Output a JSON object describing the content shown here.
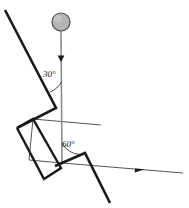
{
  "figure": {
    "name": "inclined-plane-pendulum-diagram",
    "width": 189,
    "height": 208,
    "background_color": "#ffffff"
  },
  "labels": {
    "angle_upper": "30°",
    "angle_lower": "60°"
  },
  "colors": {
    "thick_stroke": "#1a1a1a",
    "thin_stroke": "#555555",
    "ball_fill": "#b3b3b3",
    "ball_stroke": "#4d4d4d",
    "string": "#8c8c8c",
    "text": "#1a1a1a"
  },
  "elements": {
    "ball": {
      "name": "ball",
      "cx": 61,
      "cy": 22,
      "r": 9,
      "fill": "#b3b3b3",
      "stroke": "#4d4d4d"
    },
    "string": {
      "name": "string-vertical-line",
      "x1": 61,
      "y1": 31,
      "x2": 62,
      "y2": 163,
      "stroke": "#8c8c8c"
    },
    "string_arrow": {
      "name": "downward-arrowhead",
      "x": 61,
      "y": 60,
      "direction": "down"
    },
    "incline_upper": {
      "name": "incline-thick-line-upper",
      "points": "5,10 56,108"
    },
    "incline_lower": {
      "name": "incline-thick-line-lower",
      "points": "56,108 17,128"
    },
    "rhombus": {
      "name": "thick-rhombus-block",
      "points": "17,128 33,119 61,168 44,179"
    },
    "rhombus_lower": {
      "name": "thick-lower-edge",
      "points": "44,179 61,168"
    },
    "v_shape": {
      "name": "thick-v-wedge",
      "points": "62,163 85,153 110,203"
    },
    "parallelogram": {
      "name": "thin-parallelogram",
      "points": "33,119 96,119 62,163 29,163"
    },
    "ray": {
      "name": "thin-ray-right",
      "x1": 62,
      "y1": 163,
      "x2": 183,
      "y2": 173,
      "stroke": "#555555"
    },
    "ray_arrow": {
      "name": "ray-arrowhead",
      "x": 138,
      "y": 157,
      "direction": "right-down"
    },
    "arc_upper": {
      "name": "angle-arc-30"
    },
    "arc_lower": {
      "name": "angle-arc-60"
    }
  }
}
